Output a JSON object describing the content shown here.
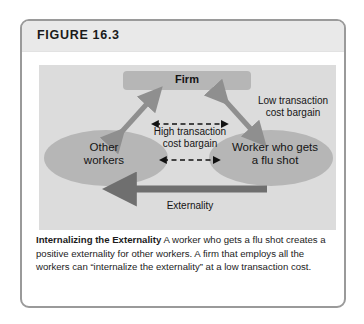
{
  "figure": {
    "number": "FIGURE 16.3",
    "caption_title": "Internalizing the Externality",
    "caption_body": " A worker who gets a flu shot creates a positive externality for other workers. A firm that employs all the workers can “internalize the externality” at a low transaction cost."
  },
  "diagram": {
    "nodes": {
      "firm": "Firm",
      "other_workers": "Other\nworkers",
      "other_workers_line1": "Other",
      "other_workers_line2": "workers",
      "worker_flu_line1": "Worker who gets",
      "worker_flu_line2": "a flu shot"
    },
    "edges": {
      "low_cost_line1": "Low transaction",
      "low_cost_line2": "cost bargain",
      "high_cost_line1": "High transaction",
      "high_cost_line2": "cost bargain",
      "externality": "Externality"
    }
  },
  "colors": {
    "card_border": "#9a9a9a",
    "header_band": "#e9e9e9",
    "panel_bg": "#dcdcdc",
    "node_fill": "#b6b6b6",
    "arrow_gray": "#8f8f8f",
    "arrow_dark": "#6f6f6f",
    "arrow_black": "#111111",
    "text": "#141414"
  }
}
